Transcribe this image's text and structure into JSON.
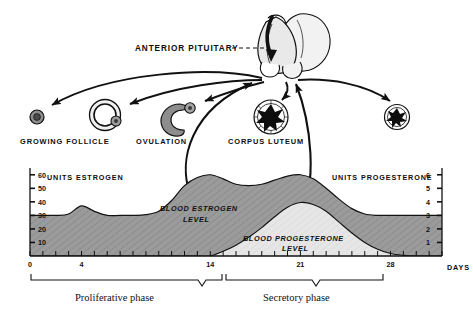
{
  "diagram": {
    "title_label": "ANTERIOR PITUITARY",
    "ovary_stages": [
      {
        "name": "growing-follicle-early",
        "label": ""
      },
      {
        "name": "growing-follicle",
        "label": "GROWING FOLLICLE"
      },
      {
        "name": "ovulation",
        "label": "OVULATION"
      },
      {
        "name": "corpus-luteum",
        "label": "CORPUS LUTEUM"
      },
      {
        "name": "regressing-corpus-luteum",
        "label": ""
      }
    ]
  },
  "chart_data": {
    "type": "area",
    "title": "",
    "xlabel": "DAYS",
    "left_axis_label": "UNITS ESTROGEN",
    "right_axis_label": "UNITS PROGESTERONE",
    "x": [
      0,
      1,
      2,
      3,
      4,
      5,
      6,
      7,
      8,
      9,
      10,
      11,
      12,
      13,
      14,
      15,
      16,
      17,
      18,
      19,
      20,
      21,
      22,
      23,
      24,
      25,
      26,
      27,
      28,
      29,
      30,
      31,
      32
    ],
    "xlim": [
      0,
      32
    ],
    "xtick_labels": [
      "0",
      "4",
      "14",
      "21",
      "28"
    ],
    "xtick_values": [
      0,
      4,
      14,
      21,
      28
    ],
    "left_ylim": [
      0,
      65
    ],
    "left_ticks": [
      10,
      20,
      30,
      40,
      50,
      60
    ],
    "right_ylim": [
      0,
      6.5
    ],
    "right_ticks": [
      1,
      2,
      3,
      4,
      5,
      6
    ],
    "grid": false,
    "legend_position": "inline-annotation",
    "series": [
      {
        "name": "BLOOD ESTROGEN LEVEL",
        "axis": "left",
        "color": "#9a9a9a",
        "values": [
          30,
          30,
          30,
          31,
          37,
          33,
          30,
          30,
          30,
          30.5,
          33,
          41,
          52,
          58,
          60,
          57,
          53,
          52,
          53,
          56,
          59,
          60,
          57,
          50,
          42,
          35,
          31,
          30,
          30,
          30,
          30,
          30,
          30
        ]
      },
      {
        "name": "BLOOD PROGESTERONE LEVEL",
        "axis": "right",
        "color": "#e2e2e2",
        "values": [
          0,
          0,
          0,
          0,
          0,
          0,
          0,
          0,
          0,
          0,
          0,
          0,
          0,
          0,
          0,
          0.35,
          0.8,
          1.4,
          2.1,
          2.9,
          3.6,
          3.95,
          3.8,
          3.3,
          2.5,
          1.7,
          1.0,
          0.5,
          0.18,
          0.05,
          0,
          0,
          0
        ]
      }
    ],
    "annotations": [
      {
        "name": "estrogen-curve-label",
        "text": "BLOOD ESTROGEN",
        "text2": "LEVEL"
      },
      {
        "name": "progesterone-curve-label",
        "text": "BLOOD PROGESTERONE",
        "text2": "LEVEL"
      }
    ],
    "phases": [
      {
        "name": "proliferative-phase",
        "label": "Proliferative phase",
        "start": 0,
        "end": 14
      },
      {
        "name": "secretory-phase",
        "label": "Secretory phase",
        "start": 14,
        "end": 28
      }
    ]
  }
}
